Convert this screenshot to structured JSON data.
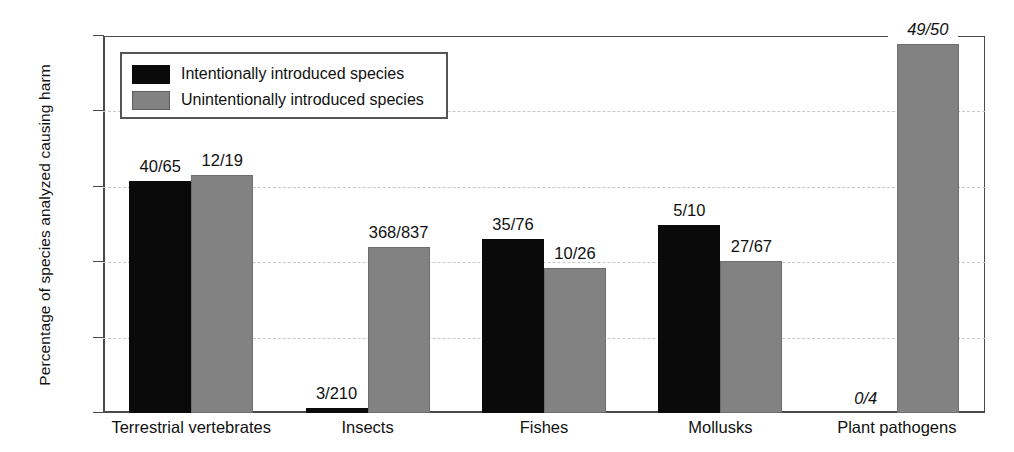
{
  "chart_data": {
    "type": "bar",
    "title": "",
    "xlabel": "",
    "ylabel": "Percentage of species analyzed causing harm",
    "ylim": [
      0,
      100
    ],
    "yticks": [
      0,
      20,
      40,
      60,
      80,
      100
    ],
    "grid": true,
    "legend_position": "top-left",
    "categories": [
      "Terrestrial vertebrates",
      "Insects",
      "Fishes",
      "Mollusks",
      "Plant pathogens"
    ],
    "series": [
      {
        "name": "Intentionally introduced species",
        "color": "#0a0a0a",
        "values": [
          61.5,
          1.4,
          46.1,
          50.0,
          0.0
        ],
        "labels": [
          "40/65",
          "3/210",
          "35/76",
          "5/10",
          "0/4"
        ],
        "label_italic": [
          false,
          false,
          false,
          false,
          true
        ]
      },
      {
        "name": "Unintentionally introduced species",
        "color": "#828282",
        "values": [
          63.2,
          44.0,
          38.5,
          40.3,
          98.0
        ],
        "labels": [
          "12/19",
          "368/837",
          "10/26",
          "27/67",
          "49/50"
        ],
        "label_italic": [
          false,
          false,
          false,
          false,
          true
        ]
      }
    ]
  },
  "legend": {
    "items": [
      {
        "label": "Intentionally introduced species",
        "swatch": "black"
      },
      {
        "label": "Unintentionally introduced species",
        "swatch": "gray"
      }
    ]
  },
  "axis": {
    "y_title": "Percentage of species analyzed causing harm",
    "y_tick_labels": [
      "100",
      "80",
      "60",
      "40",
      "20",
      "0"
    ]
  }
}
